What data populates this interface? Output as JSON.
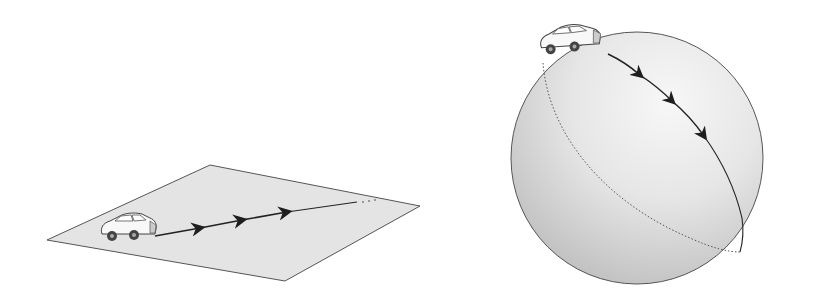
{
  "diagram": {
    "panels": [
      {
        "id": "flat-plane",
        "description": "Car driving straight on a flat plane; path continues indefinitely",
        "arrow_count": 3,
        "continuation": "..."
      },
      {
        "id": "sphere",
        "description": "Car driving along a great circle on a sphere; path wraps around back (dashed)",
        "arrow_count": 3
      }
    ],
    "colors": {
      "background": "#ffffff",
      "plane_fill": "#e4e4e4",
      "outline": "#555555",
      "path": "#222222",
      "sphere_light": "#f4f4f4",
      "sphere_dark": "#bdbdbd"
    }
  }
}
